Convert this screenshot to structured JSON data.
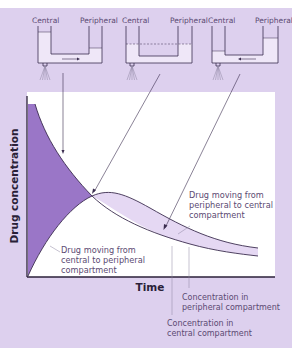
{
  "diagram": {
    "colors": {
      "panel_bg": "#ddd0ee",
      "plot_bg": "#ffffff",
      "central_fill": "#9a76c7",
      "peripheral_fill": "#e5d8f3",
      "tank_fill": "#efe7f8",
      "line": "#3b2d4f",
      "label": "#5b4a72"
    },
    "tanks": [
      {
        "left_label": "Central",
        "right_label": "Peripheral",
        "state": "central high, flow to peripheral",
        "arrow": "right"
      },
      {
        "left_label": "Central",
        "right_label": "Peripheral",
        "state": "equilibrium",
        "arrow": "none"
      },
      {
        "left_label": "Central",
        "right_label": "Peripheral",
        "state": "peripheral high, flow to central",
        "arrow": "left"
      }
    ],
    "axes": {
      "y_label": "Drug concentration",
      "x_label": "Time"
    },
    "annotations": {
      "central_to_peripheral": [
        "Drug moving from",
        "central to peripheral",
        "compartment"
      ],
      "peripheral_to_central": [
        "Drug moving from",
        "peripheral to central",
        "compartment"
      ],
      "conc_peripheral": [
        "Concentration in",
        "peripheral compartment"
      ],
      "conc_central": [
        "Concentration in",
        "central compartment"
      ]
    }
  }
}
